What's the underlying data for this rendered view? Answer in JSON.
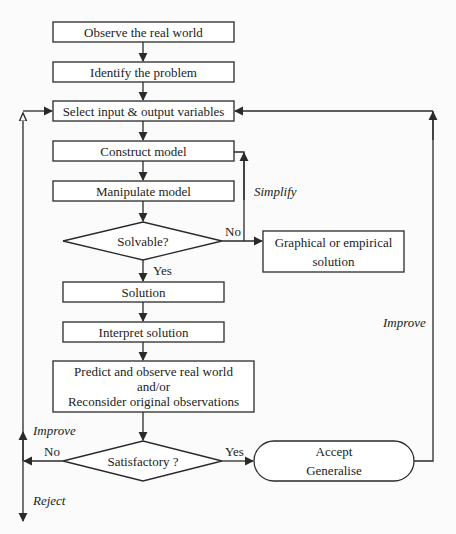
{
  "diagram": {
    "nodes": [
      {
        "id": "observe",
        "shape": "rect",
        "lines": [
          "Observe the real world"
        ]
      },
      {
        "id": "identify",
        "shape": "rect",
        "lines": [
          "Identify the problem"
        ]
      },
      {
        "id": "select",
        "shape": "rect",
        "lines": [
          "Select input & output variables"
        ]
      },
      {
        "id": "construct",
        "shape": "rect",
        "lines": [
          "Construct model"
        ]
      },
      {
        "id": "manipulate",
        "shape": "rect",
        "lines": [
          "Manipulate model"
        ]
      },
      {
        "id": "solvable",
        "shape": "diamond",
        "lines": [
          "Solvable?"
        ]
      },
      {
        "id": "graphical",
        "shape": "rect",
        "lines": [
          "Graphical or empirical",
          "solution"
        ]
      },
      {
        "id": "solution",
        "shape": "rect",
        "lines": [
          "Solution"
        ]
      },
      {
        "id": "interpret",
        "shape": "rect",
        "lines": [
          "Interpret solution"
        ]
      },
      {
        "id": "predict",
        "shape": "rect",
        "lines": [
          "Predict and observe real  world",
          "and/or",
          "Reconsider original observations"
        ]
      },
      {
        "id": "satisfactory",
        "shape": "diamond",
        "lines": [
          "Satisfactory ?"
        ]
      },
      {
        "id": "accept",
        "shape": "rounded",
        "lines": [
          "Accept",
          "Generalise"
        ]
      }
    ],
    "edge_labels": {
      "solvable_no": "No",
      "solvable_yes": "Yes",
      "simplify": "Simplify",
      "improve_right": "Improve",
      "satisfactory_no": "No",
      "satisfactory_yes": "Yes",
      "improve_left": "Improve",
      "reject": "Reject"
    },
    "edges": [
      {
        "from": "observe",
        "to": "identify"
      },
      {
        "from": "identify",
        "to": "select"
      },
      {
        "from": "select",
        "to": "construct"
      },
      {
        "from": "construct",
        "to": "manipulate"
      },
      {
        "from": "manipulate",
        "to": "solvable"
      },
      {
        "from": "solvable",
        "to": "graphical",
        "label": "No"
      },
      {
        "from": "solvable",
        "to": "construct",
        "label": "Simplify"
      },
      {
        "from": "solvable",
        "to": "solution",
        "label": "Yes"
      },
      {
        "from": "solution",
        "to": "interpret"
      },
      {
        "from": "interpret",
        "to": "predict"
      },
      {
        "from": "predict",
        "to": "satisfactory"
      },
      {
        "from": "satisfactory",
        "to": "accept",
        "label": "Yes"
      },
      {
        "from": "accept",
        "to": "select",
        "label": "Improve"
      },
      {
        "from": "satisfactory",
        "to": "select",
        "label": "No / Improve"
      },
      {
        "from": "satisfactory",
        "to": "exit",
        "label": "Reject"
      }
    ],
    "colors": {
      "stroke": "#2a2a2a",
      "fill": "#ffffff",
      "background": "#fbfbfb"
    }
  }
}
